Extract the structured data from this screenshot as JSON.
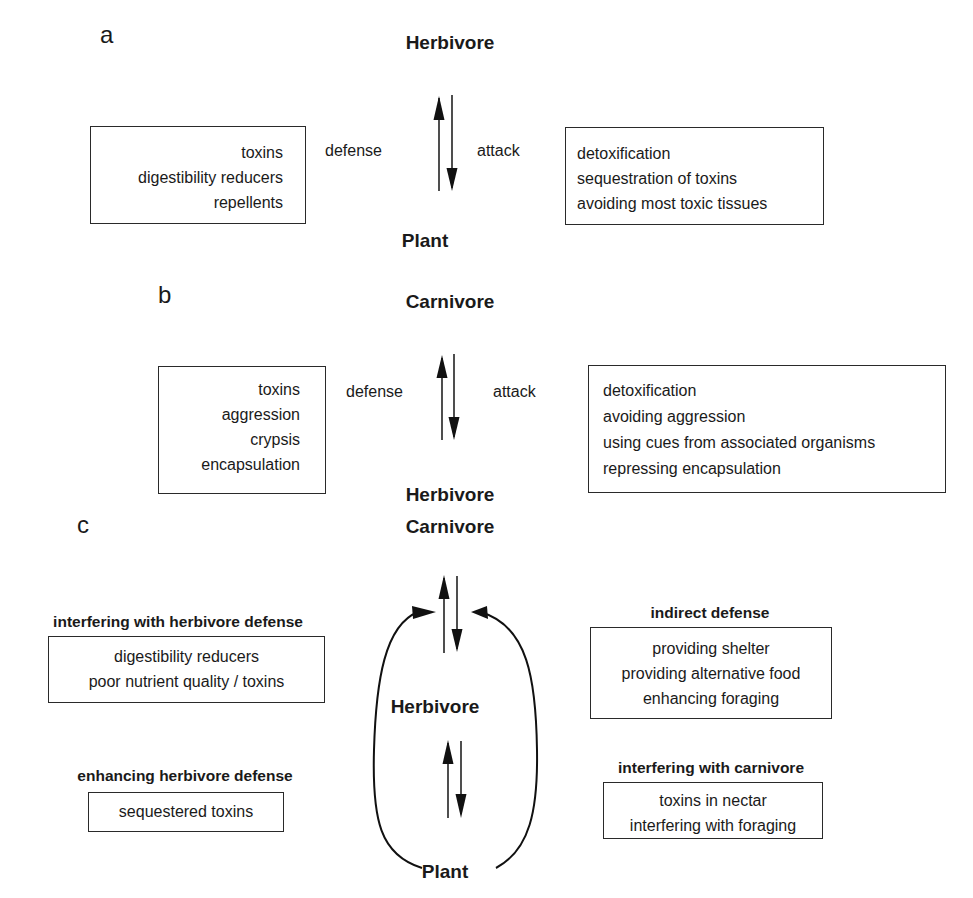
{
  "panel_a": {
    "label": "a",
    "top_node": "Herbivore",
    "bottom_node": "Plant",
    "left_relation": "defense",
    "right_relation": "attack",
    "left_box": [
      "toxins",
      "digestibility reducers",
      "repellents"
    ],
    "right_box": [
      "detoxification",
      "sequestration of toxins",
      "avoiding most toxic tissues"
    ]
  },
  "panel_b": {
    "label": "b",
    "top_node": "Carnivore",
    "bottom_node": "Herbivore",
    "left_relation": "defense",
    "right_relation": "attack",
    "left_box": [
      "toxins",
      "aggression",
      "crypsis",
      "encapsulation"
    ],
    "right_box": [
      "detoxification",
      "avoiding aggression",
      "using cues from associated organisms",
      "repressing encapsulation"
    ]
  },
  "panel_c": {
    "label": "c",
    "top_node": "Carnivore",
    "middle_node": "Herbivore",
    "bottom_node": "Plant",
    "left_groups": [
      {
        "heading": "interfering with herbivore defense",
        "items": [
          "digestibility reducers",
          "poor nutrient quality / toxins"
        ]
      },
      {
        "heading": "enhancing herbivore defense",
        "items": [
          "sequestered toxins"
        ]
      }
    ],
    "right_groups": [
      {
        "heading": "indirect defense",
        "items": [
          "providing shelter",
          "providing alternative food",
          "enhancing foraging"
        ]
      },
      {
        "heading": "interfering with carnivore",
        "items": [
          "toxins in nectar",
          "interfering with foraging"
        ]
      }
    ]
  }
}
